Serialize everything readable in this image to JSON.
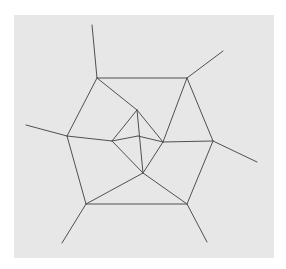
{
  "diagram": {
    "type": "planar-graph",
    "background": "#e7e7e7",
    "stroke": "#505050",
    "vertices": {
      "outer_top_left": [
        97,
        78
      ],
      "outer_top_right": [
        187,
        78
      ],
      "outer_right": [
        213,
        141
      ],
      "outer_bottom_right": [
        187,
        204
      ],
      "outer_bottom_left": [
        86,
        204
      ],
      "outer_left": [
        67,
        136
      ],
      "inner_top": [
        137,
        110
      ],
      "inner_left": [
        112,
        141
      ],
      "inner_center": [
        138,
        136
      ],
      "inner_right": [
        163,
        142
      ],
      "inner_bottom": [
        143,
        173
      ],
      "spike_top_left_end": [
        92,
        25
      ],
      "spike_top_right_end": [
        223,
        51
      ],
      "spike_right_end": [
        257,
        162
      ],
      "spike_bottom_right_end": [
        207,
        242
      ],
      "spike_bottom_left_end": [
        62,
        243
      ],
      "spike_left_end": [
        26,
        125
      ]
    },
    "edges": [
      [
        "outer_top_left",
        "outer_top_right"
      ],
      [
        "outer_top_right",
        "outer_right"
      ],
      [
        "outer_right",
        "outer_bottom_right"
      ],
      [
        "outer_bottom_right",
        "outer_bottom_left"
      ],
      [
        "outer_bottom_left",
        "outer_left"
      ],
      [
        "outer_left",
        "outer_top_left"
      ],
      [
        "outer_top_left",
        "inner_top"
      ],
      [
        "outer_top_right",
        "inner_right"
      ],
      [
        "outer_right",
        "inner_right"
      ],
      [
        "outer_bottom_right",
        "inner_bottom"
      ],
      [
        "outer_bottom_left",
        "inner_bottom"
      ],
      [
        "outer_left",
        "inner_left"
      ],
      [
        "inner_top",
        "inner_left"
      ],
      [
        "inner_top",
        "inner_right"
      ],
      [
        "inner_top",
        "inner_bottom"
      ],
      [
        "inner_left",
        "inner_bottom"
      ],
      [
        "inner_right",
        "inner_bottom"
      ],
      [
        "inner_left",
        "inner_center"
      ],
      [
        "inner_center",
        "inner_right"
      ],
      [
        "outer_top_left",
        "spike_top_left_end"
      ],
      [
        "outer_top_right",
        "spike_top_right_end"
      ],
      [
        "outer_right",
        "spike_right_end"
      ],
      [
        "outer_bottom_right",
        "spike_bottom_right_end"
      ],
      [
        "outer_bottom_left",
        "spike_bottom_left_end"
      ],
      [
        "outer_left",
        "spike_left_end"
      ]
    ]
  }
}
